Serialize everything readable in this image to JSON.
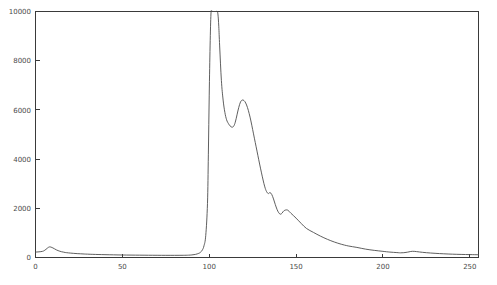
{
  "chart_data": {
    "type": "line",
    "title": "",
    "subtitle": "",
    "xlabel": "",
    "ylabel": "",
    "xlim": [
      0,
      255
    ],
    "ylim": [
      0,
      10000
    ],
    "xticks": [
      0,
      50,
      100,
      150,
      200,
      250
    ],
    "yticks": [
      0,
      2000,
      4000,
      6000,
      8000,
      10000
    ],
    "xtick_labels": [
      "0",
      "50",
      "100",
      "150",
      "200",
      "250"
    ],
    "ytick_labels": [
      "0",
      "2000",
      "4000",
      "6000",
      "8000",
      "10000"
    ],
    "grid": false,
    "legend": null,
    "legend_position": "none",
    "line_color": "#4d4d4d",
    "background_color": "#ffffff",
    "axis_color": "#3a3a3a",
    "clipped_peak": true,
    "clipped_peak_note": "Main peak near x=103 is clipped at the y-axis maximum of 10000",
    "series": [
      {
        "name": "intensity",
        "x": [
          0,
          2,
          4,
          5,
          6,
          7,
          8,
          9,
          10,
          11,
          12,
          13,
          14,
          15,
          16,
          17,
          18,
          20,
          22,
          24,
          26,
          28,
          30,
          33,
          36,
          40,
          45,
          50,
          55,
          60,
          65,
          70,
          75,
          80,
          85,
          88,
          90,
          92,
          94,
          95,
          96,
          97,
          98,
          99,
          99.5,
          100,
          100.5,
          101,
          101.5,
          102,
          102.5,
          103,
          103.5,
          104,
          104.5,
          105,
          105.5,
          106,
          107,
          108,
          109,
          110,
          111,
          112,
          113,
          114,
          115,
          116,
          117,
          118,
          119,
          120,
          121,
          122,
          123,
          124,
          125,
          126,
          127,
          128,
          129,
          130,
          131,
          132,
          133,
          134,
          135,
          136,
          137,
          138,
          139,
          140,
          141,
          142,
          143,
          145,
          147,
          150,
          153,
          156,
          160,
          164,
          168,
          172,
          176,
          180,
          185,
          190,
          195,
          200,
          204,
          208,
          210,
          212,
          214,
          216,
          218,
          221,
          225,
          230,
          235,
          240,
          245,
          250,
          255
        ],
        "y": [
          220,
          230,
          250,
          280,
          330,
          390,
          430,
          420,
          390,
          350,
          310,
          280,
          255,
          235,
          220,
          205,
          195,
          180,
          168,
          158,
          150,
          142,
          136,
          128,
          122,
          115,
          108,
          102,
          98,
          95,
          92,
          90,
          88,
          88,
          90,
          95,
          105,
          125,
          170,
          215,
          300,
          480,
          900,
          2200,
          4200,
          6600,
          8600,
          9900,
          10000,
          10000,
          10000,
          10000,
          10000,
          10000,
          10000,
          9900,
          9400,
          8600,
          7200,
          6400,
          5900,
          5600,
          5450,
          5350,
          5300,
          5330,
          5500,
          5800,
          6100,
          6320,
          6400,
          6380,
          6280,
          6100,
          5850,
          5550,
          5200,
          4850,
          4500,
          4150,
          3800,
          3470,
          3150,
          2870,
          2680,
          2600,
          2640,
          2560,
          2380,
          2160,
          1960,
          1820,
          1760,
          1810,
          1900,
          1930,
          1800,
          1600,
          1380,
          1180,
          1020,
          870,
          740,
          630,
          540,
          470,
          410,
          340,
          290,
          250,
          220,
          200,
          190,
          195,
          215,
          245,
          250,
          225,
          195,
          170,
          150,
          135,
          125,
          118,
          112
        ]
      }
    ]
  },
  "figure": {
    "frame_label": "plot-frame"
  }
}
